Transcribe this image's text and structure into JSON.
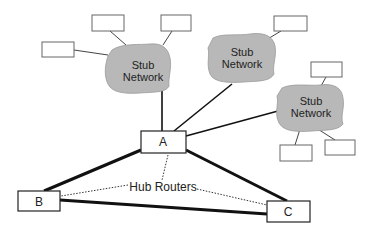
{
  "diagram": {
    "title": "",
    "colors": {
      "cloud_fill": "#b8b8b8",
      "line": "#111111",
      "thin_line": "#333333",
      "box_stroke": "#555555"
    },
    "stub_networks": [
      {
        "id": "stub-left",
        "label_line1": "Stub",
        "label_line2": "Network"
      },
      {
        "id": "stub-middle",
        "label_line1": "Stub",
        "label_line2": "Network"
      },
      {
        "id": "stub-right",
        "label_line1": "Stub",
        "label_line2": "Network"
      }
    ],
    "routers": [
      {
        "id": "A",
        "label": "A"
      },
      {
        "id": "B",
        "label": "B"
      },
      {
        "id": "C",
        "label": "C"
      }
    ],
    "hub_label": "Hub Routers"
  }
}
